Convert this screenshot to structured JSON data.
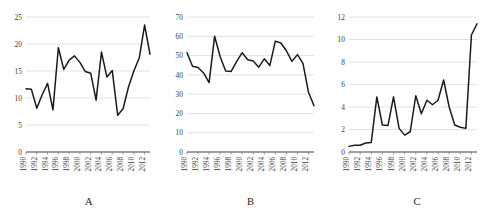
{
  "figure": {
    "panel_count": 3,
    "background_color": "#ffffff",
    "line_color": "#1a1a1a",
    "gridline_color": "#d9d9d9",
    "axis_color": "#808080"
  },
  "chart_data": [
    {
      "type": "line",
      "title": "",
      "caption": "A",
      "xlabel": "",
      "ylabel": "",
      "grid": true,
      "legend": "none",
      "xlim": [
        1990,
        2013
      ],
      "ylim": [
        0,
        25
      ],
      "ytick_values": [
        0,
        5,
        10,
        15,
        20,
        25
      ],
      "ytick_labels": [
        "0",
        "5",
        "10",
        "15",
        "20",
        "25"
      ],
      "xtick_values": [
        1990,
        1992,
        1994,
        1996,
        1998,
        2000,
        2002,
        2004,
        2006,
        2008,
        2010,
        2012
      ],
      "xtick_labels": [
        "1990",
        "1992",
        "1994",
        "1996",
        "1998",
        "2000",
        "2002",
        "2004",
        "2006",
        "2008",
        "2010",
        "2012"
      ],
      "x": [
        1990,
        1991,
        1992,
        1993,
        1994,
        1995,
        1996,
        1997,
        1998,
        1999,
        2000,
        2001,
        2002,
        2003,
        2004,
        2005,
        2006,
        2007,
        2008,
        2009,
        2010,
        2011,
        2012,
        2013
      ],
      "values": [
        11.7,
        11.6,
        8.1,
        10.6,
        12.7,
        7.8,
        19.3,
        15.3,
        17.0,
        17.8,
        16.6,
        14.9,
        14.6,
        9.6,
        18.5,
        13.9,
        15.1,
        6.8,
        8.0,
        12.0,
        15.0,
        17.4,
        23.5,
        18.1
      ]
    },
    {
      "type": "line",
      "title": "",
      "caption": "B",
      "xlabel": "",
      "ylabel": "",
      "grid": true,
      "legend": "none",
      "xlim": [
        1990,
        2013
      ],
      "ylim": [
        0,
        70
      ],
      "ytick_values": [
        0,
        10,
        20,
        30,
        40,
        50,
        60,
        70
      ],
      "ytick_labels": [
        "0",
        "10",
        "20",
        "30",
        "40",
        "50",
        "60",
        "70"
      ],
      "xtick_values": [
        1990,
        1992,
        1994,
        1996,
        1998,
        2000,
        2002,
        2004,
        2006,
        2008,
        2010,
        2012
      ],
      "xtick_labels": [
        "1990",
        "1992",
        "1994",
        "1996",
        "1998",
        "2000",
        "2002",
        "2004",
        "2006",
        "2008",
        "2010",
        "2012"
      ],
      "x": [
        1990,
        1991,
        1992,
        1993,
        1994,
        1995,
        1996,
        1997,
        1998,
        1999,
        2000,
        2001,
        2002,
        2003,
        2004,
        2005,
        2006,
        2007,
        2008,
        2009,
        2010,
        2011,
        2012,
        2013
      ],
      "values": [
        51.5,
        44.5,
        43.8,
        41.0,
        36.0,
        60.0,
        49.5,
        42.0,
        41.8,
        47.0,
        51.5,
        47.8,
        47.2,
        44.0,
        48.3,
        44.8,
        57.5,
        56.5,
        52.5,
        47.0,
        50.5,
        46.0,
        31.0,
        24.0
      ]
    },
    {
      "type": "line",
      "title": "",
      "caption": "C",
      "xlabel": "",
      "ylabel": "",
      "grid": true,
      "legend": "none",
      "xlim": [
        1990,
        2013
      ],
      "ylim": [
        0,
        12
      ],
      "ytick_values": [
        0,
        2,
        4,
        6,
        8,
        10,
        12
      ],
      "ytick_labels": [
        "0",
        "2",
        "4",
        "6",
        "8",
        "10",
        "12"
      ],
      "xtick_values": [
        1990,
        1992,
        1994,
        1996,
        1998,
        2000,
        2002,
        2004,
        2006,
        2008,
        2010,
        2012
      ],
      "xtick_labels": [
        "1990",
        "1992",
        "1994",
        "1996",
        "1998",
        "2000",
        "2002",
        "2004",
        "2006",
        "2008",
        "2010",
        "2012"
      ],
      "x": [
        1990,
        1991,
        1992,
        1993,
        1994,
        1995,
        1996,
        1997,
        1998,
        1999,
        2000,
        2001,
        2002,
        2003,
        2004,
        2005,
        2006,
        2007,
        2008,
        2009,
        2010,
        2011,
        2012,
        2013
      ],
      "values": [
        0.5,
        0.6,
        0.6,
        0.8,
        0.85,
        4.9,
        2.4,
        2.35,
        4.9,
        2.1,
        1.5,
        1.8,
        5.0,
        3.4,
        4.6,
        4.2,
        4.6,
        6.4,
        4.0,
        2.4,
        2.2,
        2.1,
        10.4,
        11.4
      ]
    }
  ]
}
